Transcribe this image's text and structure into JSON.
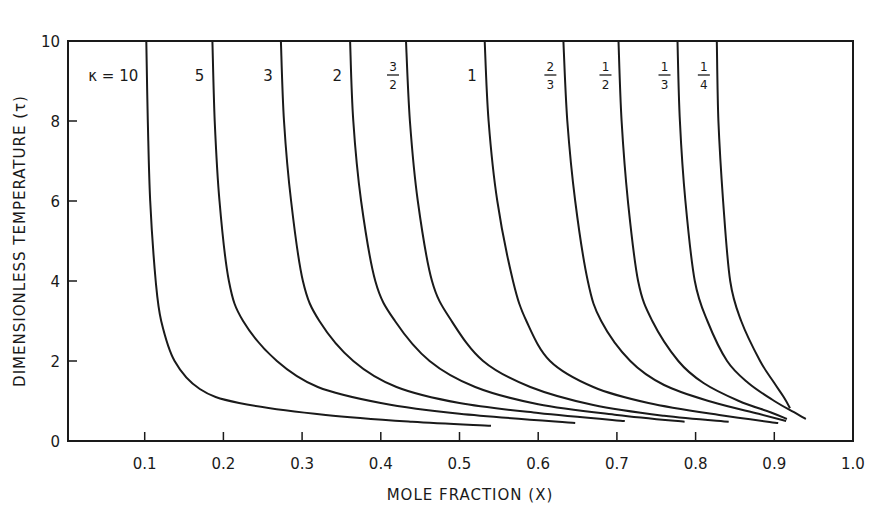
{
  "chart_data": {
    "type": "line",
    "title": "",
    "xlabel": "MOLE FRACTION (X)",
    "ylabel": "DIMENSIONLESS  TEMPERATURE (τ)",
    "xlim": [
      0,
      1.0
    ],
    "ylim": [
      0,
      10
    ],
    "x_ticks": [
      "0.1",
      "0.2",
      "0.3",
      "0.4",
      "0.5",
      "0.6",
      "0.7",
      "0.8",
      "0.9",
      "1.0"
    ],
    "y_ticks": [
      "0",
      "2",
      "4",
      "6",
      "8",
      "10"
    ],
    "grid": false,
    "legend": "inline labels at top of each curve",
    "legend_prefix": "κ =",
    "series": [
      {
        "name": "10",
        "label": "10",
        "points": [
          [
            0.102,
            10
          ],
          [
            0.104,
            8
          ],
          [
            0.107,
            6
          ],
          [
            0.114,
            4
          ],
          [
            0.121,
            3
          ],
          [
            0.138,
            2
          ],
          [
            0.17,
            1.3
          ],
          [
            0.22,
            0.95
          ],
          [
            0.33,
            0.65
          ],
          [
            0.44,
            0.48
          ],
          [
            0.54,
            0.38
          ]
        ]
      },
      {
        "name": "5",
        "label": "5",
        "points": [
          [
            0.186,
            10
          ],
          [
            0.189,
            8
          ],
          [
            0.195,
            6
          ],
          [
            0.207,
            4
          ],
          [
            0.225,
            3
          ],
          [
            0.268,
            2
          ],
          [
            0.32,
            1.35
          ],
          [
            0.4,
            0.95
          ],
          [
            0.5,
            0.68
          ],
          [
            0.647,
            0.45
          ]
        ]
      },
      {
        "name": "3",
        "label": "3",
        "points": [
          [
            0.273,
            10
          ],
          [
            0.277,
            8
          ],
          [
            0.286,
            6
          ],
          [
            0.301,
            4
          ],
          [
            0.322,
            3
          ],
          [
            0.365,
            2
          ],
          [
            0.42,
            1.35
          ],
          [
            0.5,
            0.95
          ],
          [
            0.6,
            0.7
          ],
          [
            0.71,
            0.5
          ]
        ]
      },
      {
        "name": "2",
        "label": "2",
        "points": [
          [
            0.361,
            10
          ],
          [
            0.365,
            8
          ],
          [
            0.375,
            6
          ],
          [
            0.393,
            4
          ],
          [
            0.418,
            3
          ],
          [
            0.462,
            2
          ],
          [
            0.52,
            1.35
          ],
          [
            0.6,
            0.92
          ],
          [
            0.7,
            0.65
          ],
          [
            0.786,
            0.48
          ]
        ]
      },
      {
        "name": "3/2",
        "label": "3/2",
        "points": [
          [
            0.432,
            10
          ],
          [
            0.437,
            8
          ],
          [
            0.447,
            6
          ],
          [
            0.465,
            4
          ],
          [
            0.49,
            3
          ],
          [
            0.53,
            2
          ],
          [
            0.59,
            1.35
          ],
          [
            0.67,
            0.9
          ],
          [
            0.76,
            0.63
          ],
          [
            0.842,
            0.48
          ]
        ]
      },
      {
        "name": "1",
        "label": "1",
        "points": [
          [
            0.532,
            10
          ],
          [
            0.537,
            8
          ],
          [
            0.548,
            6
          ],
          [
            0.568,
            4
          ],
          [
            0.585,
            3
          ],
          [
            0.615,
            2
          ],
          [
            0.67,
            1.35
          ],
          [
            0.74,
            0.95
          ],
          [
            0.83,
            0.65
          ],
          [
            0.905,
            0.45
          ]
        ]
      },
      {
        "name": "2/3",
        "label": "2/3",
        "points": [
          [
            0.632,
            10
          ],
          [
            0.637,
            8
          ],
          [
            0.647,
            6
          ],
          [
            0.663,
            4
          ],
          [
            0.68,
            3
          ],
          [
            0.717,
            2
          ],
          [
            0.76,
            1.4
          ],
          [
            0.82,
            0.98
          ],
          [
            0.88,
            0.68
          ],
          [
            0.915,
            0.5
          ]
        ]
      },
      {
        "name": "1/2",
        "label": "1/2",
        "points": [
          [
            0.702,
            10
          ],
          [
            0.706,
            8
          ],
          [
            0.714,
            6
          ],
          [
            0.727,
            4
          ],
          [
            0.745,
            3
          ],
          [
            0.778,
            2
          ],
          [
            0.81,
            1.45
          ],
          [
            0.855,
            1.0
          ],
          [
            0.895,
            0.72
          ],
          [
            0.916,
            0.55
          ]
        ]
      },
      {
        "name": "1/3",
        "label": "1/3",
        "points": [
          [
            0.777,
            10
          ],
          [
            0.78,
            8
          ],
          [
            0.787,
            6
          ],
          [
            0.799,
            4
          ],
          [
            0.815,
            3
          ],
          [
            0.84,
            2
          ],
          [
            0.867,
            1.45
          ],
          [
            0.9,
            1.0
          ],
          [
            0.925,
            0.72
          ],
          [
            0.94,
            0.55
          ]
        ]
      },
      {
        "name": "1/4",
        "label": "1/4",
        "points": [
          [
            0.827,
            10
          ],
          [
            0.829,
            8
          ],
          [
            0.835,
            6
          ],
          [
            0.844,
            4
          ],
          [
            0.858,
            3
          ],
          [
            0.882,
            2
          ],
          [
            0.9,
            1.45
          ],
          [
            0.912,
            1.1
          ],
          [
            0.92,
            0.82
          ]
        ]
      }
    ]
  },
  "plot": {
    "px_left": 68,
    "px_right": 853,
    "px_top": 41,
    "px_bottom": 441,
    "x_zero_px": 66,
    "x_one_px": 853,
    "line_color": "#1a1a1a",
    "bg_color": "#ffffff"
  },
  "labels": {
    "kappa_prefix": "κ =",
    "xlabel": "MOLE FRACTION (X)",
    "ylabel": "DIMENSIONLESS  TEMPERATURE (τ)"
  }
}
